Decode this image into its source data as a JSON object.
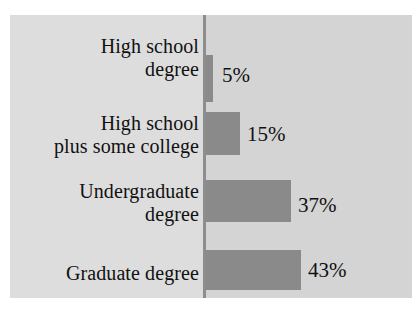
{
  "chart_data": {
    "type": "bar",
    "orientation": "horizontal",
    "title": "",
    "subtitle": "",
    "xlabel": "",
    "ylabel": "",
    "grid": false,
    "legend": null,
    "axis_range": [
      0,
      43
    ],
    "categories": [
      "High school\ndegree",
      "High school\nplus some college",
      "Undergraduate\ndegree",
      "Graduate degree"
    ],
    "values": [
      5,
      15,
      37,
      43
    ],
    "value_labels": [
      "5%",
      "15%",
      "37%",
      "43%"
    ],
    "bars": [
      {
        "category": "High school\ndegree",
        "value": 5,
        "label": "5%"
      },
      {
        "category": "High school\nplus some college",
        "value": 15,
        "label": "15%"
      },
      {
        "category": "Undergraduate\ndegree",
        "value": 37,
        "label": "37%"
      },
      {
        "category": "Graduate degree",
        "value": 43,
        "label": "43%"
      }
    ]
  },
  "colors": {
    "page_background": "#ffffff",
    "panel_background": "#dddddd",
    "plot_field": "#d4d4d4",
    "bar_fill": "#8a8a8a",
    "axis_line": "#8d8d8d",
    "text": "#111111"
  }
}
